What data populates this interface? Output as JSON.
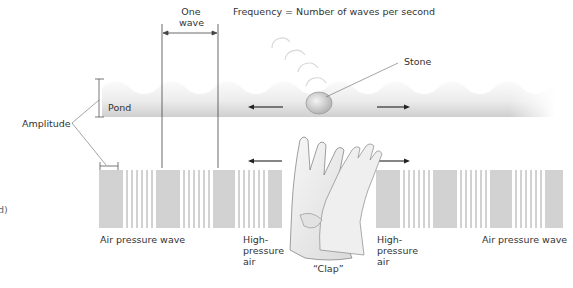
{
  "labels": {
    "one_wave": "One\nwave",
    "frequency": "Frequency = Number of waves per second",
    "stone": "Stone",
    "pond": "Pond",
    "amplitude": "Amplitude",
    "left_edge_fragment": "d)",
    "air_pressure_wave_left": "Air pressure wave",
    "high_pressure_left": "High-\npressure\nair",
    "clap": "“Clap”",
    "high_pressure_right": "High-\npressure\nair",
    "air_pressure_wave_right": "Air pressure wave"
  },
  "colors": {
    "pond_dark": "#cfcfcf",
    "pond_light": "#f2f2f2",
    "bars": "#9a9a9a",
    "lines": "#444444",
    "text": "#333333"
  },
  "pressure_wave": {
    "description": "Alternating compressions (dense bars) and rarefactions (sparse bars)",
    "dense_bar_spacing_px": 2,
    "sparse_bar_spacing_px": 5,
    "wavelength_px": 56
  }
}
